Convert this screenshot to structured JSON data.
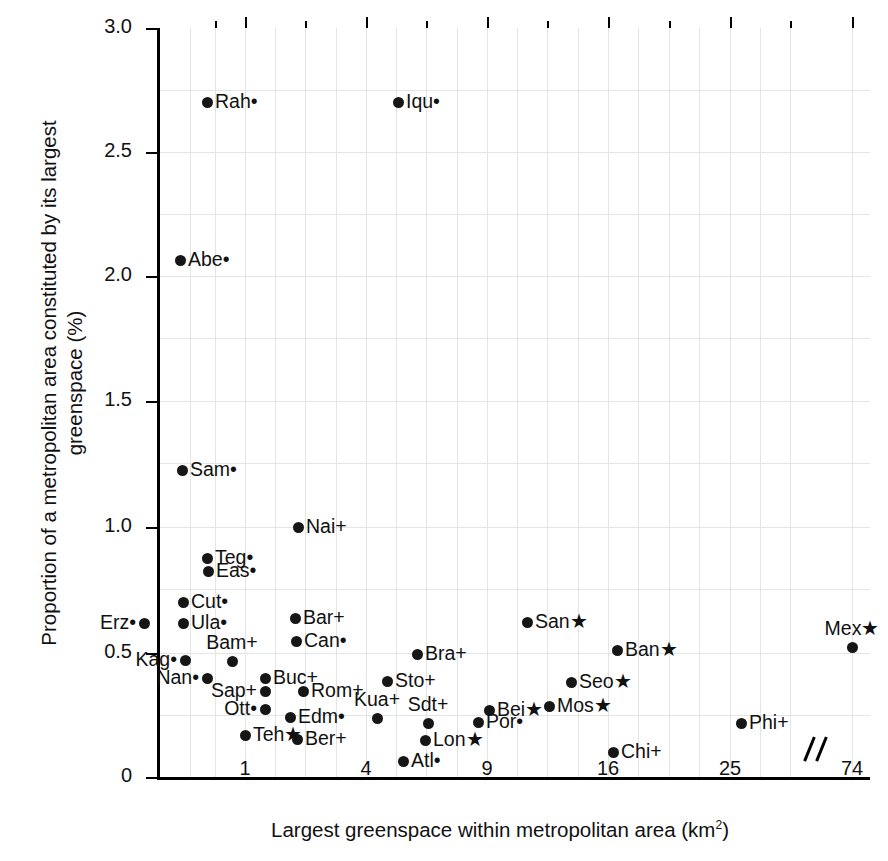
{
  "chart_data": {
    "type": "scatter",
    "title": "",
    "xlabel": "Largest greenspace within metropolitan area (km2)",
    "ylabel": "Proportion of a metropolitan area constituted by its largest\ngreenspace (%)",
    "xlabel_base": "Largest greenspace within metropolitan area (km",
    "xlabel_sup": "2",
    "xlabel_tail": ")",
    "x_scale": "sqrt-with-axis-break",
    "xticks": [
      "1",
      "4",
      "9",
      "16",
      "25",
      "74"
    ],
    "yticks": [
      "3.0",
      "2.5",
      "2.0",
      "1.5",
      "1.0",
      "0.5",
      "0"
    ],
    "xlim": [
      0,
      74
    ],
    "ylim": [
      0,
      3.0
    ],
    "grid": true,
    "axis_break": true,
    "marker_suffixes": {
      "dot": "•",
      "plus": "+",
      "star": "★"
    },
    "points": [
      {
        "label": "Rah",
        "suffix": "•",
        "x": 0.42,
        "y": 2.7,
        "px": 207,
        "py": 102,
        "side": "r"
      },
      {
        "label": "Iqu",
        "suffix": "•",
        "x": 5.1,
        "y": 2.7,
        "px": 398,
        "py": 102,
        "side": "r"
      },
      {
        "label": "Abe",
        "suffix": "•",
        "x": 0.24,
        "y": 2.07,
        "px": 180,
        "py": 260,
        "side": "r"
      },
      {
        "label": "Sam",
        "suffix": "•",
        "x": 0.27,
        "y": 1.23,
        "px": 182,
        "py": 470,
        "side": "r"
      },
      {
        "label": "Nai",
        "suffix": "+",
        "x": 1.84,
        "y": 1.0,
        "px": 298,
        "py": 527,
        "side": "r"
      },
      {
        "label": "Teg",
        "suffix": "•",
        "x": 0.47,
        "y": 0.88,
        "px": 207,
        "py": 558,
        "side": "r"
      },
      {
        "label": "Eas",
        "suffix": "•",
        "x": 0.48,
        "y": 0.83,
        "px": 208,
        "py": 571,
        "side": "r"
      },
      {
        "label": "Cut",
        "suffix": "•",
        "x": 0.25,
        "y": 0.7,
        "px": 183,
        "py": 602,
        "side": "r"
      },
      {
        "label": "Erz",
        "suffix": "•",
        "x": 0.1,
        "y": 0.62,
        "px": 144,
        "py": 623,
        "side": "l"
      },
      {
        "label": "Ula",
        "suffix": "•",
        "x": 0.25,
        "y": 0.62,
        "px": 183,
        "py": 623,
        "side": "r"
      },
      {
        "label": "San",
        "suffix": "★",
        "x": 11.3,
        "y": 0.63,
        "px": 527,
        "py": 622,
        "side": "r"
      },
      {
        "label": "Bar",
        "suffix": "+",
        "x": 1.76,
        "y": 0.6,
        "px": 295,
        "py": 618,
        "side": "r"
      },
      {
        "label": "Can",
        "suffix": "•",
        "x": 1.8,
        "y": 0.56,
        "px": 296,
        "py": 641,
        "side": "r"
      },
      {
        "label": "Ban",
        "suffix": "★",
        "x": 16.6,
        "y": 0.52,
        "px": 617,
        "py": 650,
        "side": "r"
      },
      {
        "label": "Mex",
        "suffix": "★",
        "x": 74.0,
        "y": 0.53,
        "px": 852,
        "py": 647,
        "side": "t"
      },
      {
        "label": "Bra",
        "suffix": "+",
        "x": 5.7,
        "y": 0.5,
        "px": 417,
        "py": 654,
        "side": "r"
      },
      {
        "label": "Kag",
        "suffix": "•",
        "x": 0.26,
        "y": 0.47,
        "px": 185,
        "py": 660,
        "side": "l"
      },
      {
        "label": "Bam",
        "suffix": "+",
        "x": 0.89,
        "y": 0.46,
        "px": 232,
        "py": 661,
        "side": "t"
      },
      {
        "label": "Sto",
        "suffix": "+",
        "x": 4.55,
        "y": 0.39,
        "px": 387,
        "py": 681,
        "side": "r"
      },
      {
        "label": "Seo",
        "suffix": "★",
        "x": 13.6,
        "y": 0.38,
        "px": 571,
        "py": 682,
        "side": "r"
      },
      {
        "label": "Nan",
        "suffix": "•",
        "x": 0.41,
        "y": 0.39,
        "px": 207,
        "py": 678,
        "side": "l"
      },
      {
        "label": "Buc",
        "suffix": "+",
        "x": 1.3,
        "y": 0.39,
        "px": 265,
        "py": 678,
        "side": "r"
      },
      {
        "label": "Rom",
        "suffix": "+",
        "x": 1.9,
        "y": 0.35,
        "px": 303,
        "py": 691,
        "side": "r"
      },
      {
        "label": "Sap",
        "suffix": "+",
        "x": 1.3,
        "y": 0.34,
        "px": 265,
        "py": 691,
        "side": "l"
      },
      {
        "label": "Mos",
        "suffix": "★",
        "x": 12.3,
        "y": 0.31,
        "px": 549,
        "py": 706,
        "side": "r"
      },
      {
        "label": "Bei",
        "suffix": "★",
        "x": 9.15,
        "y": 0.29,
        "px": 489,
        "py": 710,
        "side": "r"
      },
      {
        "label": "Sdt",
        "suffix": "+",
        "x": 6.1,
        "y": 0.27,
        "px": 428,
        "py": 723,
        "side": "t"
      },
      {
        "label": "Edm",
        "suffix": "•",
        "x": 1.72,
        "y": 0.25,
        "px": 290,
        "py": 717,
        "side": "r"
      },
      {
        "label": "Ott",
        "suffix": "•",
        "x": 1.3,
        "y": 0.23,
        "px": 265,
        "py": 709,
        "side": "l"
      },
      {
        "label": "Kua",
        "suffix": "+",
        "x": 4.35,
        "y": 0.25,
        "px": 377,
        "py": 718,
        "side": "t"
      },
      {
        "label": "Por",
        "suffix": "•",
        "x": 8.5,
        "y": 0.23,
        "px": 478,
        "py": 722,
        "side": "r"
      },
      {
        "label": "Phi",
        "suffix": "+",
        "x": 25.8,
        "y": 0.22,
        "px": 741,
        "py": 723,
        "side": "r"
      },
      {
        "label": "Ber",
        "suffix": "+",
        "x": 1.82,
        "y": 0.16,
        "px": 297,
        "py": 739,
        "side": "r"
      },
      {
        "label": "Lon",
        "suffix": "★",
        "x": 6.05,
        "y": 0.16,
        "px": 425,
        "py": 740,
        "side": "r"
      },
      {
        "label": "Teh",
        "suffix": "★",
        "x": 1.0,
        "y": 0.17,
        "px": 245,
        "py": 735,
        "side": "r"
      },
      {
        "label": "Chi",
        "suffix": "+",
        "x": 16.4,
        "y": 0.11,
        "px": 613,
        "py": 752,
        "side": "r"
      },
      {
        "label": "Atl",
        "suffix": "•",
        "x": 5.3,
        "y": 0.07,
        "px": 403,
        "py": 761,
        "side": "r"
      }
    ],
    "x_tick_px": [
      245,
      366,
      487,
      608,
      730,
      852
    ],
    "y_tick_px": [
      28,
      152,
      276,
      401,
      527,
      653,
      777
    ],
    "gridv_px": [
      190,
      215,
      245,
      275,
      305,
      336,
      366,
      396,
      426,
      457,
      487,
      517,
      547,
      578,
      608,
      638,
      669,
      699,
      730,
      760,
      790,
      852
    ],
    "gridh_px": [
      90,
      152,
      214,
      276,
      338,
      401,
      463,
      527,
      589,
      653,
      715
    ]
  }
}
